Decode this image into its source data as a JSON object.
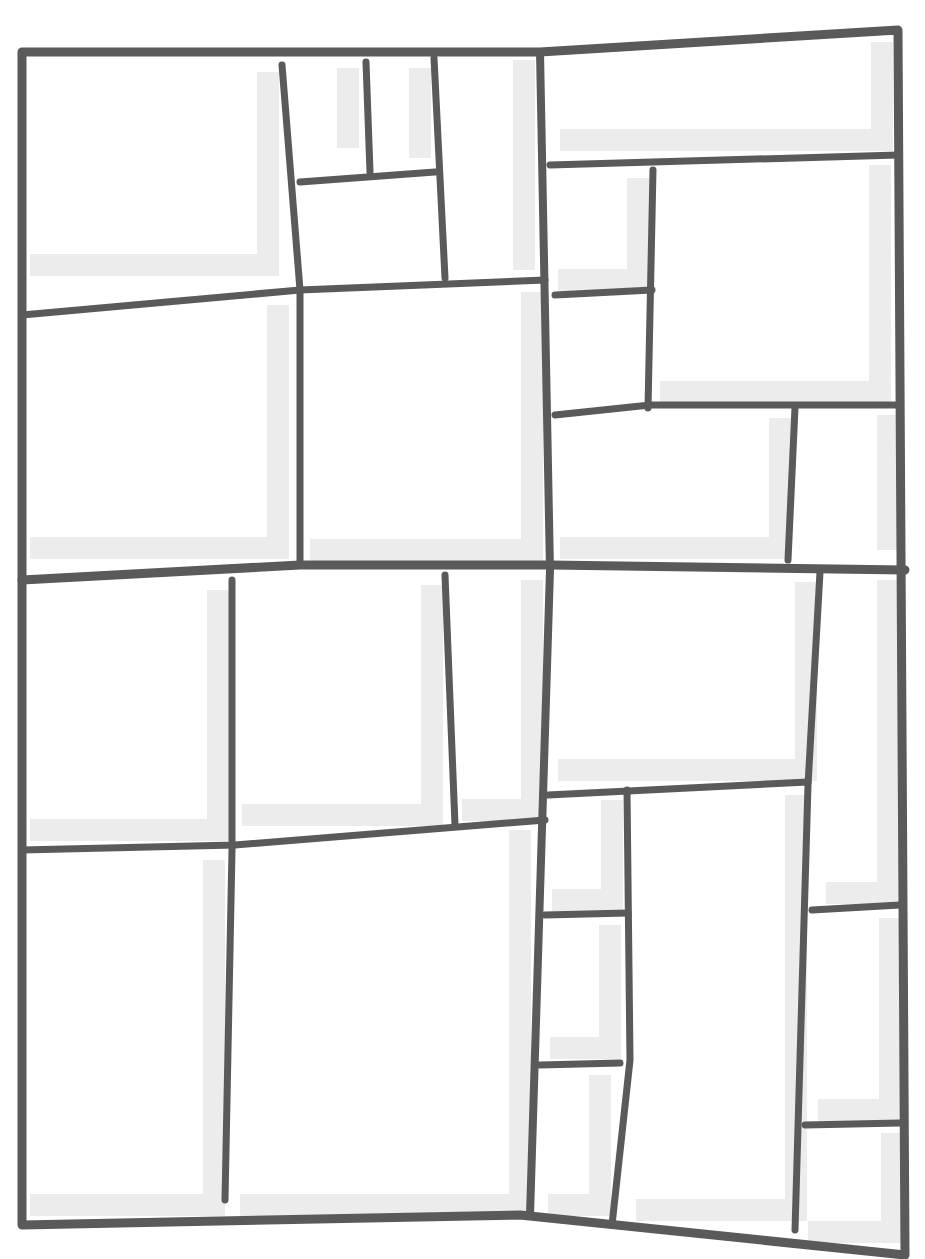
{
  "drawing": {
    "background": "#ffffff",
    "line_color": "#5a5a5a",
    "shadow_color": "#ececec",
    "outer_width": 9,
    "inner_width": 7,
    "outer_border": [
      [
        22,
        52
      ],
      [
        540,
        52
      ],
      [
        898,
        30
      ],
      [
        905,
        1255
      ],
      [
        520,
        1215
      ],
      [
        22,
        1225
      ]
    ],
    "lines": [
      {
        "id": "main-vertical",
        "pts": [
          [
            540,
            52
          ],
          [
            550,
            570
          ],
          [
            530,
            1215
          ]
        ],
        "w": 8
      },
      {
        "id": "main-horizontal",
        "pts": [
          [
            22,
            580
          ],
          [
            300,
            565
          ],
          [
            550,
            565
          ],
          [
            905,
            570
          ]
        ],
        "w": 9
      },
      {
        "id": "q1-h-mid",
        "pts": [
          [
            22,
            315
          ],
          [
            300,
            290
          ],
          [
            545,
            280
          ]
        ]
      },
      {
        "id": "q1-v-left",
        "pts": [
          [
            282,
            65
          ],
          [
            300,
            290
          ],
          [
            300,
            565
          ]
        ]
      },
      {
        "id": "q1-v-mid",
        "pts": [
          [
            366,
            62
          ],
          [
            370,
            172
          ]
        ]
      },
      {
        "id": "q1-v-right",
        "pts": [
          [
            434,
            58
          ],
          [
            445,
            278
          ]
        ]
      },
      {
        "id": "q1-h-small",
        "pts": [
          [
            300,
            182
          ],
          [
            435,
            172
          ]
        ]
      },
      {
        "id": "q2-h-top",
        "pts": [
          [
            550,
            165
          ],
          [
            898,
            155
          ]
        ]
      },
      {
        "id": "q2-v-small",
        "pts": [
          [
            653,
            170
          ],
          [
            648,
            408
          ]
        ]
      },
      {
        "id": "q2-h-small",
        "pts": [
          [
            555,
            295
          ],
          [
            652,
            290
          ]
        ]
      },
      {
        "id": "q2-h-bottom",
        "pts": [
          [
            555,
            415
          ],
          [
            650,
            405
          ],
          [
            898,
            405
          ]
        ]
      },
      {
        "id": "q2-v-bottom",
        "pts": [
          [
            795,
            408
          ],
          [
            788,
            560
          ]
        ]
      },
      {
        "id": "q3-v-left",
        "pts": [
          [
            232,
            580
          ],
          [
            232,
            850
          ],
          [
            225,
            1200
          ]
        ]
      },
      {
        "id": "q3-v-right",
        "pts": [
          [
            445,
            575
          ],
          [
            455,
            825
          ]
        ]
      },
      {
        "id": "q3-h",
        "pts": [
          [
            22,
            850
          ],
          [
            235,
            845
          ],
          [
            545,
            820
          ]
        ]
      },
      {
        "id": "q4-v-right",
        "pts": [
          [
            820,
            572
          ],
          [
            808,
            785
          ],
          [
            795,
            1230
          ]
        ]
      },
      {
        "id": "q4-h-mid",
        "pts": [
          [
            548,
            795
          ],
          [
            808,
            782
          ]
        ]
      },
      {
        "id": "q4-v-mid",
        "pts": [
          [
            627,
            790
          ],
          [
            630,
            1060
          ],
          [
            612,
            1225
          ]
        ]
      },
      {
        "id": "q4-h-left-1",
        "pts": [
          [
            545,
            915
          ],
          [
            628,
            913
          ]
        ]
      },
      {
        "id": "q4-h-left-2",
        "pts": [
          [
            540,
            1065
          ],
          [
            620,
            1063
          ]
        ]
      },
      {
        "id": "q4-h-right-1",
        "pts": [
          [
            812,
            910
          ],
          [
            900,
            905
          ]
        ]
      },
      {
        "id": "q4-h-right-2",
        "pts": [
          [
            805,
            1125
          ],
          [
            900,
            1123
          ]
        ]
      }
    ],
    "shadows": [
      [
        [
          268,
          72
        ],
        [
          268,
          265
        ],
        [
          30,
          265
        ]
      ],
      [
        [
          348,
          68
        ],
        [
          348,
          148
        ]
      ],
      [
        [
          420,
          68
        ],
        [
          420,
          158
        ]
      ],
      [
        [
          524,
          60
        ],
        [
          524,
          270
        ]
      ],
      [
        [
          882,
          42
        ],
        [
          882,
          140
        ],
        [
          560,
          140
        ]
      ],
      [
        [
          638,
          178
        ],
        [
          638,
          280
        ],
        [
          558,
          280
        ]
      ],
      [
        [
          880,
          165
        ],
        [
          880,
          392
        ],
        [
          660,
          392
        ]
      ],
      [
        [
          780,
          418
        ],
        [
          780,
          548
        ],
        [
          560,
          548
        ]
      ],
      [
        [
          888,
          415
        ],
        [
          888,
          550
        ]
      ],
      [
        [
          278,
          305
        ],
        [
          278,
          548
        ],
        [
          30,
          548
        ]
      ],
      [
        [
          532,
          292
        ],
        [
          532,
          550
        ],
        [
          310,
          550
        ]
      ],
      [
        [
          218,
          590
        ],
        [
          218,
          830
        ],
        [
          30,
          830
        ]
      ],
      [
        [
          432,
          585
        ],
        [
          432,
          815
        ],
        [
          242,
          815
        ]
      ],
      [
        [
          532,
          580
        ],
        [
          532,
          810
        ],
        [
          462,
          810
        ]
      ],
      [
        [
          806,
          582
        ],
        [
          806,
          770
        ],
        [
          558,
          770
        ]
      ],
      [
        [
          888,
          580
        ],
        [
          888,
          893
        ],
        [
          826,
          893
        ]
      ],
      [
        [
          214,
          860
        ],
        [
          214,
          1205
        ],
        [
          30,
          1205
        ]
      ],
      [
        [
          520,
          830
        ],
        [
          520,
          1205
        ],
        [
          240,
          1205
        ]
      ],
      [
        [
          612,
          800
        ],
        [
          612,
          900
        ],
        [
          552,
          900
        ]
      ],
      [
        [
          610,
          925
        ],
        [
          610,
          1048
        ],
        [
          550,
          1048
        ]
      ],
      [
        [
          600,
          1075
        ],
        [
          600,
          1205
        ],
        [
          548,
          1205
        ]
      ],
      [
        [
          796,
          795
        ],
        [
          796,
          1210
        ],
        [
          636,
          1210
        ]
      ],
      [
        [
          890,
          918
        ],
        [
          890,
          1110
        ],
        [
          818,
          1110
        ]
      ],
      [
        [
          892,
          1133
        ],
        [
          892,
          1232
        ],
        [
          808,
          1232
        ]
      ]
    ]
  }
}
